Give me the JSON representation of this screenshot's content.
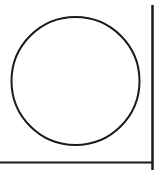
{
  "diagram": {
    "background": "#ffffff",
    "stroke_color": "#1a1a1a",
    "shapes": [
      {
        "type": "circle",
        "cx": 75.5,
        "cy": 81,
        "r": 64,
        "stroke_width": 2
      },
      {
        "type": "line",
        "name": "vertical-axis",
        "x1": 152.5,
        "y1": 5,
        "x2": 152.5,
        "y2": 170,
        "stroke_width": 2.5
      },
      {
        "type": "line",
        "name": "horizontal-axis",
        "x1": 0,
        "y1": 162.5,
        "x2": 153,
        "y2": 162.5,
        "stroke_width": 2
      }
    ]
  }
}
